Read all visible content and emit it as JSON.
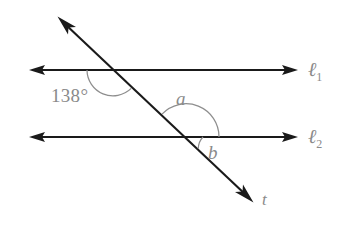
{
  "figure": {
    "background_color": "#ffffff",
    "line_color": "#1a1a1a",
    "annotation_color": "#8a8a8a",
    "arc_color": "#8e8e8e",
    "width": 347,
    "height": 225
  },
  "lines": [
    {
      "id": "l1",
      "label_base": "ℓ",
      "label_subscript": "1",
      "kind": "parallel-line",
      "y": 70,
      "x_start": 30,
      "x_end": 297,
      "arrowheads": "both"
    },
    {
      "id": "l2",
      "label_base": "ℓ",
      "label_subscript": "2",
      "kind": "parallel-line",
      "y": 137,
      "x_start": 30,
      "x_end": 297,
      "arrowheads": "both"
    },
    {
      "id": "t",
      "label_base": "t",
      "label_subscript": "",
      "kind": "transversal",
      "x_start": 58,
      "y_start": 17,
      "x_end": 253,
      "y_end": 202,
      "arrowheads": "both"
    }
  ],
  "intersections": [
    {
      "id": "upper",
      "x": 113,
      "y": 70,
      "on_line": "l1"
    },
    {
      "id": "lower",
      "x": 186,
      "y": 137,
      "on_line": "l2"
    }
  ],
  "angles": [
    {
      "id": "angle-138",
      "label": "138°",
      "value": 138,
      "unit": "degrees",
      "at_intersection": "upper",
      "arc_radius": 26,
      "label_x": 51,
      "label_y": 86
    },
    {
      "id": "angle-a",
      "label": "a",
      "value": null,
      "unit": "unknown",
      "at_intersection": "lower",
      "arc_radius": 33,
      "label_x": 176,
      "label_y": 89
    },
    {
      "id": "angle-b",
      "label": "b",
      "value": null,
      "unit": "unknown",
      "at_intersection": "lower",
      "arc_radius": 17,
      "label_x": 208,
      "label_y": 143
    }
  ],
  "labels": {
    "angle_138": "138°",
    "angle_a": "a",
    "angle_b": "b",
    "line_t": "t",
    "line_l1_base": "ℓ",
    "line_l1_sub": "1",
    "line_l2_base": "ℓ",
    "line_l2_sub": "2"
  }
}
